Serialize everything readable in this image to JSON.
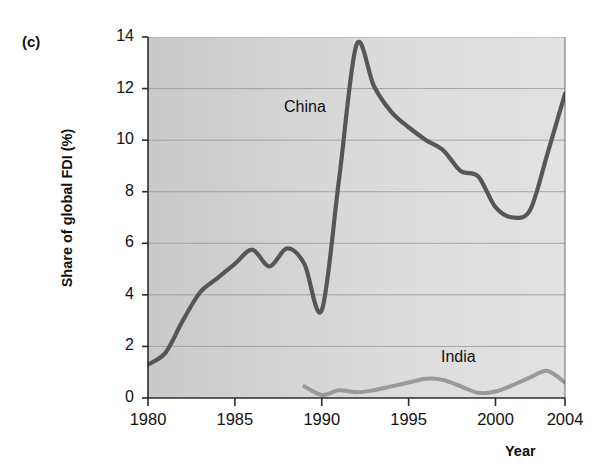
{
  "figure": {
    "panel_label": "(c)",
    "scan_artifact_text": "",
    "background_color": "#d6d6d6",
    "line_color_china": "#565656",
    "line_color_india": "#9a9a9a",
    "gridline_color": "#9b9b9b",
    "axis_color": "#2b2b2b"
  },
  "chart_data": {
    "type": "line",
    "title": "",
    "xlabel": "Year",
    "ylabel": "Share of global FDI (%)",
    "xlim": [
      1980,
      2004
    ],
    "ylim": [
      0,
      14
    ],
    "xticks": [
      1980,
      1985,
      1990,
      1995,
      2000,
      2004
    ],
    "yticks": [
      0,
      2,
      4,
      6,
      8,
      10,
      12,
      14
    ],
    "grid": "horizontal",
    "legend": "inline-labels",
    "series": [
      {
        "name": "China",
        "color": "#565656",
        "x": [
          1980,
          1981,
          1982,
          1983,
          1984,
          1985,
          1986,
          1987,
          1988,
          1989,
          1990,
          1991,
          1992,
          1993,
          1994,
          1995,
          1996,
          1997,
          1998,
          1999,
          2000,
          2001,
          2002,
          2003,
          2004
        ],
        "values": [
          1.3,
          1.75,
          3.0,
          4.1,
          4.65,
          5.2,
          5.75,
          5.1,
          5.8,
          5.2,
          3.4,
          8.5,
          13.7,
          12.1,
          11.1,
          10.5,
          10.0,
          9.6,
          8.8,
          8.6,
          7.4,
          7.0,
          7.3,
          9.5,
          11.8
        ]
      },
      {
        "name": "India",
        "color": "#9a9a9a",
        "x": [
          1989,
          1990,
          1991,
          1992,
          1993,
          1994,
          1995,
          1996,
          1997,
          1998,
          1999,
          2000,
          2001,
          2002,
          2003,
          2004
        ],
        "values": [
          0.45,
          0.12,
          0.3,
          0.22,
          0.3,
          0.45,
          0.6,
          0.75,
          0.7,
          0.45,
          0.2,
          0.25,
          0.5,
          0.8,
          1.05,
          0.6
        ]
      }
    ]
  },
  "annotations": [
    {
      "text": "China",
      "series": "China"
    },
    {
      "text": "India",
      "series": "India"
    }
  ],
  "axis": {
    "y_tick_labels": [
      "14",
      "12",
      "10",
      "8",
      "6",
      "4",
      "2",
      "0"
    ],
    "x_tick_labels": [
      "1980",
      "1985",
      "1990",
      "1995",
      "2000",
      "2004"
    ]
  }
}
